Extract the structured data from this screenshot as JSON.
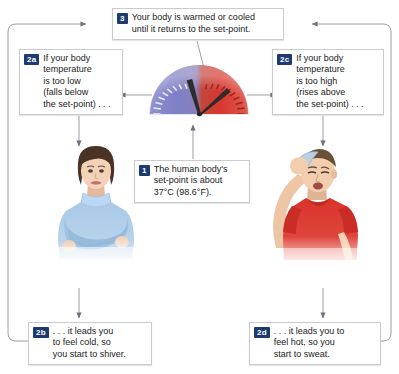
{
  "diagram": {
    "accent_badge_color": "#1e3b70",
    "box_border_color": "#c8ccd2",
    "gauge": {
      "cold_color": "#7b7ec8",
      "hot_color": "#d83a32",
      "needle_color": "#2b2b2b",
      "tick_color_cold": "#ffffff",
      "tick_color_hot": "#8e1f1a"
    }
  },
  "boxes": {
    "step3": {
      "badge": "3",
      "text": "Your body is warmed or cooled\nuntil it returns to the set-point."
    },
    "step2a": {
      "badge": "2a",
      "text": "If your body\ntemperature\nis too low\n(falls below\nthe set-point) . . ."
    },
    "step2c": {
      "badge": "2c",
      "text": "If your body\ntemperature\nis too high\n(rises above\nthe set-point) . . ."
    },
    "step1": {
      "badge": "1",
      "text": "The human body's\nset-point is about\n37°C (98.6°F)."
    },
    "step2b": {
      "badge": "2b",
      "text": ". . . it leads you\nto feel cold, so\nyou start to shiver."
    },
    "step2d": {
      "badge": "2d",
      "text": ". . . it leads you to\nfeel hot, so you\nstart to sweat."
    }
  },
  "figures": {
    "cold": {
      "name": "woman-feeling-cold",
      "description": "Woman in light blue turtleneck with arms crossed, shivering",
      "shirt_color": "#a9c9e8",
      "hair_color": "#4a3226",
      "skin_color": "#f0cdb4"
    },
    "hot": {
      "name": "man-feeling-hot",
      "description": "Man in red t-shirt wiping his forehead with a blue cloth, sweating",
      "shirt_color": "#d8332b",
      "hair_color": "#6b5038",
      "skin_color": "#f2cdae",
      "cloth_color": "#b8cfe4"
    }
  }
}
